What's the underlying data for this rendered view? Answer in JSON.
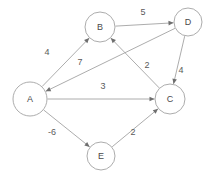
{
  "diagram": {
    "type": "directed-weighted-graph",
    "background_color": "#ffffff",
    "edge_color": "#a3a3a3",
    "node_fill": "#ffffff",
    "node_stroke": "#a3a3a3",
    "label_color": "#4a4a4a",
    "weight_color": "#5a5a5a",
    "arrow_color": "#6e6e6e"
  },
  "nodes": [
    {
      "id": "A",
      "label": "A",
      "cx": 30,
      "cy": 99,
      "r": 17
    },
    {
      "id": "B",
      "label": "B",
      "cx": 100,
      "cy": 27,
      "r": 15
    },
    {
      "id": "C",
      "label": "C",
      "cx": 170,
      "cy": 99,
      "r": 15
    },
    {
      "id": "D",
      "label": "D",
      "cx": 188,
      "cy": 22,
      "r": 14
    },
    {
      "id": "E",
      "label": "E",
      "cx": 101,
      "cy": 156,
      "r": 14
    }
  ],
  "edges": [
    {
      "id": "A-B",
      "from": "A",
      "to": "B",
      "weight": "4",
      "label_x": 47,
      "label_y": 53
    },
    {
      "id": "B-D",
      "from": "B",
      "to": "D",
      "weight": "5",
      "label_x": 143,
      "label_y": 13
    },
    {
      "id": "D-A",
      "from": "D",
      "to": "A",
      "weight": "7",
      "label_x": 80,
      "label_y": 63
    },
    {
      "id": "D-C",
      "from": "D",
      "to": "C",
      "weight": "4",
      "label_x": 181,
      "label_y": 71
    },
    {
      "id": "C-B",
      "from": "C",
      "to": "B",
      "weight": "2",
      "label_x": 147,
      "label_y": 66
    },
    {
      "id": "A-C",
      "from": "A",
      "to": "C",
      "weight": "3",
      "label_x": 103,
      "label_y": 87
    },
    {
      "id": "A-E",
      "from": "A",
      "to": "E",
      "weight": "-6",
      "label_x": 52,
      "label_y": 133
    },
    {
      "id": "E-C",
      "from": "E",
      "to": "C",
      "weight": "2",
      "label_x": 133,
      "label_y": 133
    }
  ]
}
